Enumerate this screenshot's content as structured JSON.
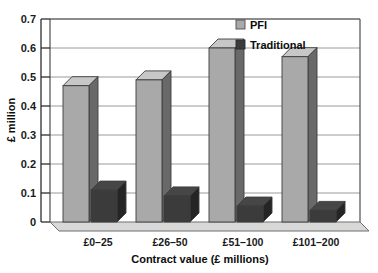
{
  "chart_data": {
    "type": "bar",
    "title": "",
    "xlabel": "Contract value (£ millions)",
    "ylabel": "£ million",
    "categories": [
      "£0–25",
      "£26–50",
      "£51–100",
      "£101–200"
    ],
    "series": [
      {
        "name": "PFI",
        "values": [
          0.47,
          0.49,
          0.6,
          0.57
        ],
        "color": "#a9a9a9"
      },
      {
        "name": "Traditional",
        "values": [
          0.11,
          0.09,
          0.055,
          0.04
        ],
        "color": "#3b3b3b"
      }
    ],
    "ylim": [
      0,
      0.7
    ],
    "yticks": [
      "0",
      "0.1",
      "0.2",
      "0.3",
      "0.4",
      "0.5",
      "0.6",
      "0.7"
    ],
    "ytick_values": [
      0,
      0.1,
      0.2,
      0.3,
      0.4,
      0.5,
      0.6,
      0.7
    ],
    "grid": true,
    "grid_axis": "y",
    "legend_position": "top-right",
    "style": "3d-column",
    "plot_background": "#ffffff",
    "grid_color": "#9a9a9a",
    "axis_color": "#4d4d4d"
  },
  "legend": {
    "entries": [
      {
        "label": "PFI",
        "swatch_name": "legend-swatch-pfi"
      },
      {
        "label": "Traditional",
        "swatch_name": "legend-swatch-traditional"
      }
    ]
  },
  "axes": {
    "y_title": "£ million",
    "x_title": "Contract value (£ millions)"
  }
}
